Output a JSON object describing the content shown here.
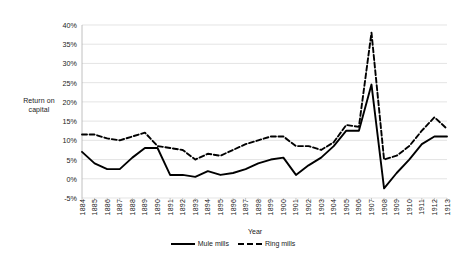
{
  "chart_data": {
    "type": "line",
    "title": "",
    "xlabel": "Year",
    "ylabel": "Return on capital",
    "ylabel_lines": [
      "Return on",
      "capital"
    ],
    "grid": true,
    "legend_position": "bottom-center",
    "ylim": [
      -5,
      40
    ],
    "ytick_step": 5,
    "ytick_labels": [
      "40%",
      "35%",
      "30%",
      "25%",
      "20%",
      "15%",
      "10%",
      "5%",
      "0%",
      "-5%"
    ],
    "ytick_values": [
      40,
      35,
      30,
      25,
      20,
      15,
      10,
      5,
      0,
      -5
    ],
    "categories": [
      "1884",
      "1885",
      "1886",
      "1887",
      "1888",
      "1889",
      "1890",
      "1891",
      "1892",
      "1893",
      "1894",
      "1895",
      "1896",
      "1897",
      "1898",
      "1899",
      "1900",
      "1901",
      "1902",
      "1903",
      "1904",
      "1905",
      "1906",
      "1907",
      "1908",
      "1909",
      "1910",
      "1911",
      "1912",
      "1913"
    ],
    "series": [
      {
        "name": "Mule mills",
        "style": "solid",
        "color": "#000000",
        "values": [
          7.0,
          4.0,
          2.5,
          2.5,
          5.5,
          8.0,
          8.0,
          1.0,
          1.0,
          0.5,
          2.0,
          1.0,
          1.5,
          2.5,
          4.0,
          5.0,
          5.5,
          1.0,
          3.5,
          5.5,
          8.5,
          12.5,
          12.5,
          24.5,
          -2.5,
          1.5,
          5.0,
          9.0,
          11.0,
          11.0
        ]
      },
      {
        "name": "Ring mills",
        "style": "dashed",
        "color": "#000000",
        "values": [
          11.5,
          11.5,
          10.5,
          10.0,
          11.0,
          12.0,
          8.5,
          8.0,
          7.5,
          5.0,
          6.5,
          6.0,
          7.5,
          9.0,
          10.0,
          11.0,
          11.0,
          8.5,
          8.5,
          7.5,
          9.5,
          14.0,
          13.5,
          38.0,
          5.0,
          6.0,
          8.5,
          12.5,
          16.0,
          13.0
        ]
      }
    ]
  },
  "legend": {
    "items": [
      {
        "label": "Mule mills"
      },
      {
        "label": "Ring mills"
      }
    ]
  }
}
